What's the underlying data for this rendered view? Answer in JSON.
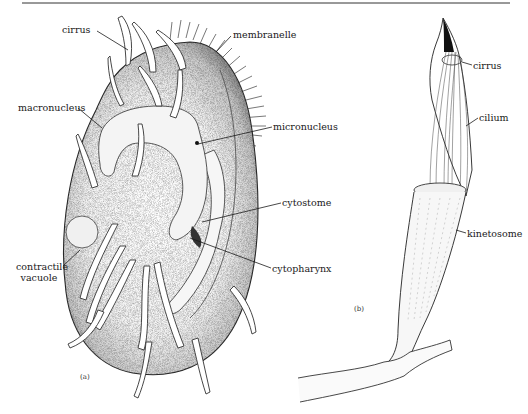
{
  "figure": {
    "panels": [
      {
        "id": "a",
        "panel_label": "(a)",
        "subject": "ciliate cell (hypotrich)",
        "labels": {
          "cirrus": "cirrus",
          "membranelle": "membranelle",
          "macronucleus": "macronucleus",
          "micronucleus": "micronucleus",
          "cytostome": "cytostome",
          "cytopharynx": "cytopharynx",
          "contractile_vacuole_line1": "contractile",
          "contractile_vacuole_line2": "vacuole"
        }
      },
      {
        "id": "b",
        "panel_label": "(b)",
        "subject": "cirrus structure",
        "labels": {
          "cirrus": "cirrus",
          "cilium": "cilium",
          "kinetosome": "kinetosome"
        }
      }
    ],
    "colors": {
      "ink": "#1a1a1a",
      "stipple": "#8a8a8a",
      "background": "#ffffff"
    }
  }
}
